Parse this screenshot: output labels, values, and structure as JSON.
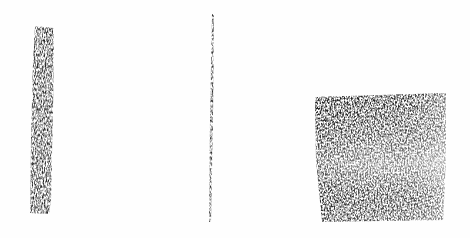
{
  "scene": {
    "description": "Three graphite/charcoal marks on white paper",
    "background_color": "#fefefe",
    "marks": [
      {
        "name": "thick-vertical-stroke",
        "x": 29,
        "y": 25,
        "width": 25,
        "height": 190,
        "color": "#2a2a2a"
      },
      {
        "name": "thin-vertical-line",
        "x": 209,
        "y": 14,
        "width": 4,
        "height": 208,
        "color": "#3a3a3a"
      },
      {
        "name": "shaded-square",
        "x": 315,
        "y": 93,
        "width": 132,
        "height": 128,
        "color": "#3c3c3c"
      }
    ]
  }
}
